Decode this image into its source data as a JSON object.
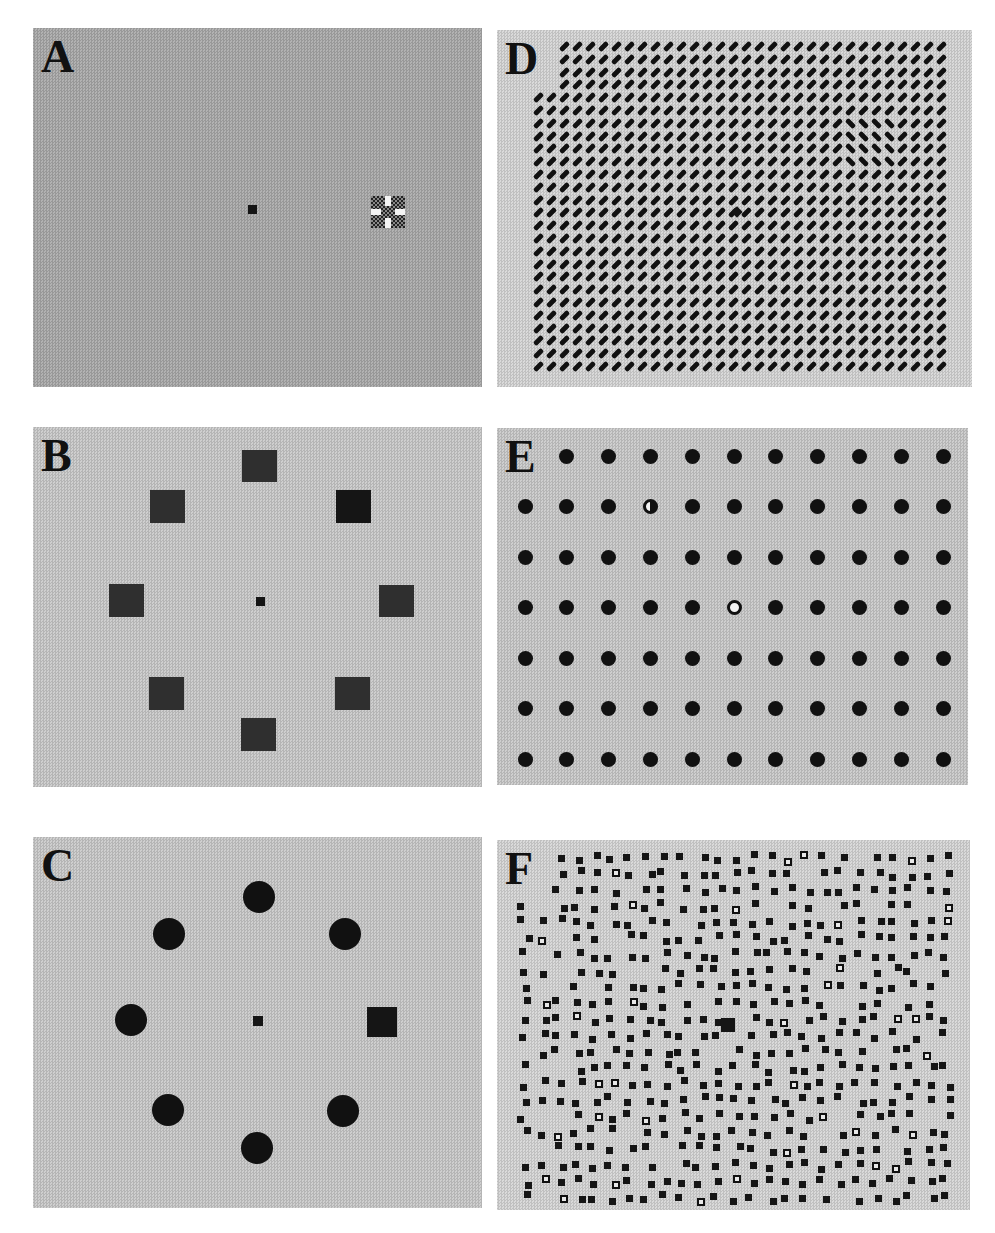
{
  "figure": {
    "panels": [
      {
        "id": "A",
        "label": "A",
        "description": "Uniform gray field with small central fixation square and a checkerboard target with white cross to the right"
      },
      {
        "id": "B",
        "label": "B",
        "description": "Eight dark squares arranged in a ring around a central fixation square"
      },
      {
        "id": "C",
        "label": "C",
        "description": "Seven black disks and one black square arranged in a ring around a central fixation square"
      },
      {
        "id": "D",
        "label": "D",
        "description": "Dense grid of oriented line segments (texture) with an odd-orientation patch upper right and a central fixation mark"
      },
      {
        "id": "E",
        "label": "E",
        "description": "Regular 11x7 grid of black dots with one half-filled dot and one ring (open) dot"
      },
      {
        "id": "F",
        "label": "F",
        "description": "Jittered array of small black squares with a larger central square and a few open squares"
      }
    ],
    "colors": {
      "background": "#ffffff",
      "panel_gray": "#c9c9c9",
      "stimulus_black": "#111111"
    },
    "panel_E": {
      "columns": 11,
      "rows": 7,
      "half_filled_dot": {
        "row": 2,
        "col": 4
      },
      "ring_dot": {
        "row": 4,
        "col": 6
      }
    }
  }
}
